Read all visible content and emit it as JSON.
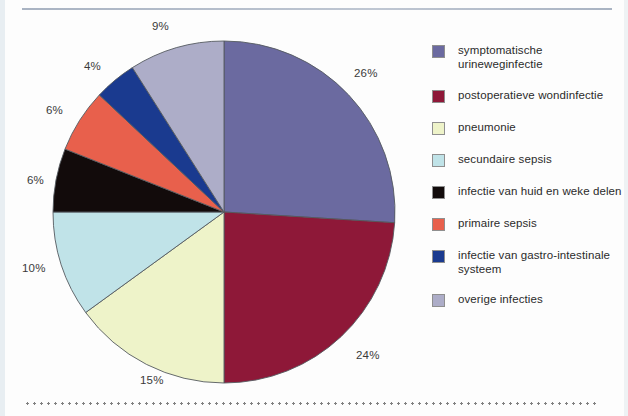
{
  "chart_data": {
    "type": "pie",
    "title": "",
    "subtitle": "",
    "xlabel": "",
    "ylabel": "",
    "legend_position": "right",
    "grid": false,
    "start_angle_deg": 0,
    "direction": "clockwise",
    "unit": "%",
    "categories": [
      "symptomatische urineweginfectie",
      "postoperatieve wondinfectie",
      "pneumonie",
      "secundaire sepsis",
      "infectie van huid en weke delen",
      "primaire sepsis",
      "infectie van gastro-intestinale systeem",
      "overige infecties"
    ],
    "values": [
      26,
      24,
      15,
      10,
      6,
      6,
      4,
      9
    ],
    "labels": [
      "26%",
      "24%",
      "15%",
      "10%",
      "6%",
      "6%",
      "4%",
      "9%"
    ],
    "colors": [
      "#6B6AA0",
      "#8E1838",
      "#EEF3C9",
      "#C0E3E8",
      "#120B0B",
      "#E8604C",
      "#1A3A8F",
      "#ADADC8"
    ],
    "slices": [
      {
        "label": "symptomatische urineweginfectie",
        "value": 26,
        "display": "26%",
        "color": "#6B6AA0"
      },
      {
        "label": "postoperatieve wondinfectie",
        "value": 24,
        "display": "24%",
        "color": "#8E1838"
      },
      {
        "label": "pneumonie",
        "value": 15,
        "display": "15%",
        "color": "#EEF3C9"
      },
      {
        "label": "secundaire sepsis",
        "value": 10,
        "display": "10%",
        "color": "#C0E3E8"
      },
      {
        "label": "infectie van huid en weke delen",
        "value": 6,
        "display": "6%",
        "color": "#120B0B"
      },
      {
        "label": "primaire sepsis",
        "value": 6,
        "display": "6%",
        "color": "#E8604C"
      },
      {
        "label": "infectie van gastro-intestinale systeem",
        "value": 4,
        "display": "4%",
        "color": "#1A3A8F"
      },
      {
        "label": "overige infecties",
        "value": 9,
        "display": "9%",
        "color": "#ADADC8"
      }
    ]
  },
  "pie_labels": [
    {
      "text": "26%",
      "x": 354,
      "y": 68
    },
    {
      "text": "24%",
      "x": 356,
      "y": 350
    },
    {
      "text": "15%",
      "x": 140,
      "y": 375
    },
    {
      "text": "10%",
      "x": 22,
      "y": 263
    },
    {
      "text": "6%",
      "x": 27,
      "y": 175
    },
    {
      "text": "6%",
      "x": 46,
      "y": 105
    },
    {
      "text": "4%",
      "x": 84,
      "y": 61
    },
    {
      "text": "9%",
      "x": 152,
      "y": 21
    }
  ],
  "legend": {
    "items": [
      {
        "label": "symptomatische urineweginfectie",
        "color": "#6B6AA0",
        "swatch_name": "legend-swatch-symptomatische-urineweginfectie"
      },
      {
        "label": "postoperatieve wondinfectie",
        "color": "#8E1838",
        "swatch_name": "legend-swatch-postoperatieve-wondinfectie"
      },
      {
        "label": "pneumonie",
        "color": "#EEF3C9",
        "swatch_name": "legend-swatch-pneumonie"
      },
      {
        "label": "secundaire sepsis",
        "color": "#C0E3E8",
        "swatch_name": "legend-swatch-secundaire-sepsis"
      },
      {
        "label": "infectie van huid en weke delen",
        "color": "#120B0B",
        "swatch_name": "legend-swatch-infectie-huid-weke-delen"
      },
      {
        "label": "primaire sepsis",
        "color": "#E8604C",
        "swatch_name": "legend-swatch-primaire-sepsis"
      },
      {
        "label": "infectie van gastro-intestinale systeem",
        "color": "#1A3A8F",
        "swatch_name": "legend-swatch-gastro-intestinale-systeem"
      },
      {
        "label": "overige infecties",
        "color": "#ADADC8",
        "swatch_name": "legend-swatch-overige-infecties"
      }
    ]
  }
}
